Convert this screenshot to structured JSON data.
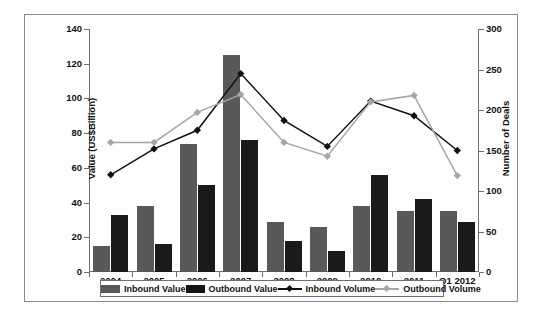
{
  "chart_data": {
    "type": "bar",
    "title": "",
    "subtitle": "",
    "xlabel": "",
    "ylabel": "Value (US$Billion)",
    "y2label": "Number of Deals",
    "ylim": [
      0,
      140
    ],
    "y2lim": [
      0,
      300
    ],
    "yticks": [
      0,
      20,
      40,
      60,
      80,
      100,
      120,
      140
    ],
    "y2ticks": [
      0,
      50,
      100,
      150,
      200,
      250,
      300
    ],
    "grid": false,
    "legend_position": "bottom",
    "categories": [
      "2004",
      "2005",
      "2006",
      "2007",
      "2008",
      "2009",
      "2010",
      "2011",
      "Q1 2012"
    ],
    "series": [
      {
        "name": "Inbound Value",
        "type": "bar",
        "axis": "left",
        "unit": "US$Billion",
        "color": "#595959",
        "values": [
          15,
          38,
          74,
          125,
          29,
          26,
          38,
          35,
          35
        ]
      },
      {
        "name": "Outbound Value",
        "type": "bar",
        "axis": "left",
        "unit": "US$Billion",
        "color": "#1a1a1a",
        "values": [
          33,
          16,
          50,
          76,
          18,
          12,
          56,
          42,
          29
        ]
      },
      {
        "name": "Inbound Volume",
        "type": "line",
        "axis": "right",
        "unit": "Number of Deals",
        "color": "#111111",
        "marker": "diamond",
        "values": [
          120,
          152,
          175,
          245,
          187,
          155,
          211,
          193,
          150
        ]
      },
      {
        "name": "Outbound Volume",
        "type": "line",
        "axis": "right",
        "unit": "Number of Deals",
        "color": "#a6a6a6",
        "marker": "diamond",
        "values": [
          160,
          160,
          197,
          219,
          160,
          143,
          210,
          218,
          119
        ]
      }
    ]
  },
  "legend": {
    "items": [
      {
        "label": "Inbound Value",
        "kind": "bar",
        "color": "#595959"
      },
      {
        "label": "Outbound Value",
        "kind": "bar",
        "color": "#141414"
      },
      {
        "label": "Inbound Volume",
        "kind": "line",
        "color": "#111111"
      },
      {
        "label": "Outbound Volume",
        "kind": "line",
        "color": "#a6a6a6"
      }
    ]
  },
  "axes": {
    "left_title": "Value (US$Billion)",
    "right_title": "Number of Deals",
    "left_ticks": [
      "0",
      "20",
      "40",
      "60",
      "80",
      "100",
      "120",
      "140"
    ],
    "right_ticks": [
      "0",
      "50",
      "100",
      "150",
      "200",
      "250",
      "300"
    ]
  }
}
